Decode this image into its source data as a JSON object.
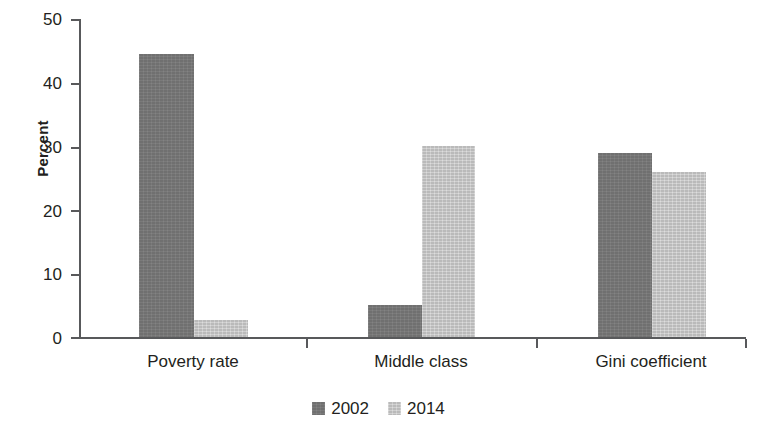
{
  "chart_data": {
    "type": "bar",
    "title": "",
    "subtitle": "",
    "xlabel": "",
    "ylabel": "Percent",
    "categories": [
      "Poverty rate",
      "Middle class",
      "Gini coefficient"
    ],
    "series": [
      {
        "name": "2002",
        "color": "#787878",
        "values": [
          44.5,
          5.0,
          29.0
        ]
      },
      {
        "name": "2014",
        "color": "#c9c9c9",
        "values": [
          2.7,
          30.0,
          26.0
        ]
      }
    ],
    "ylim": [
      0,
      50
    ],
    "yticks": [
      0,
      10,
      20,
      30,
      40,
      50
    ],
    "ytick_labels": [
      "0",
      "10",
      "20",
      "30",
      "40",
      "50"
    ],
    "grid": false,
    "legend_position": "bottom-center",
    "legend_entries": [
      "2002",
      "2014"
    ],
    "annotations": []
  },
  "axis": {
    "y_title": "Percent",
    "ticks": [
      {
        "label": "50",
        "value": 50
      },
      {
        "label": "40",
        "value": 40
      },
      {
        "label": "30",
        "value": 30
      },
      {
        "label": "20",
        "value": 20
      },
      {
        "label": "10",
        "value": 10
      },
      {
        "label": "0",
        "value": 0
      }
    ]
  },
  "legend": {
    "items": [
      {
        "label": "2002",
        "color": "#787878"
      },
      {
        "label": "2014",
        "color": "#c9c9c9"
      }
    ]
  },
  "categories": [
    {
      "label": "Poverty rate"
    },
    {
      "label": "Middle class"
    },
    {
      "label": "Gini coefficient"
    }
  ]
}
